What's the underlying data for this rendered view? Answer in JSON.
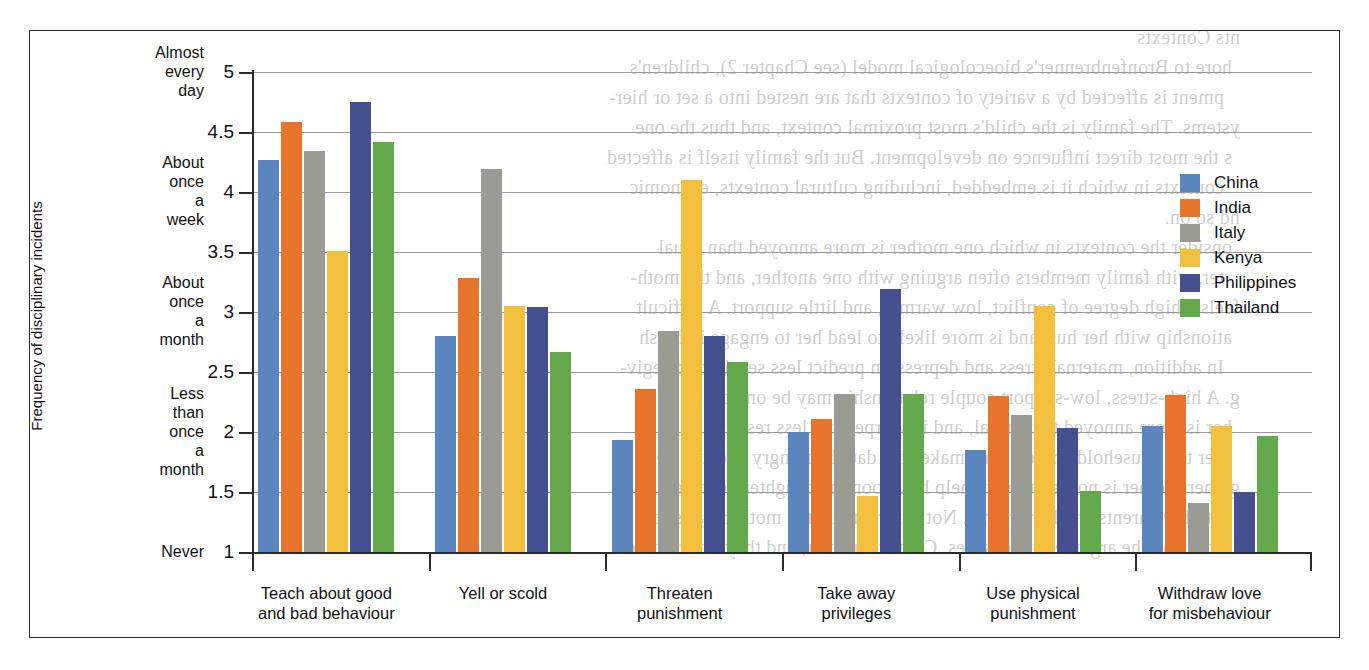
{
  "chart_data": {
    "type": "bar",
    "title": "",
    "xlabel": "",
    "ylabel": "Frequency of disciplinary incidents",
    "ylim": [
      1,
      5
    ],
    "grid": true,
    "legend_position": "upper-right-inside",
    "categories": [
      "Teach about good\nand bad behaviour",
      "Yell or scold",
      "Threaten\npunishment",
      "Take away\nprivileges",
      "Use physical\npunishment",
      "Withdraw love\nfor misbehaviour"
    ],
    "yticks": [
      {
        "value": 1,
        "label": "1",
        "category_label": "Never"
      },
      {
        "value": 1.5,
        "label": "1.5",
        "category_label": ""
      },
      {
        "value": 2,
        "label": "2",
        "category_label": "Less than once\na month"
      },
      {
        "value": 2.5,
        "label": "2.5",
        "category_label": ""
      },
      {
        "value": 3,
        "label": "3",
        "category_label": "About once\na month"
      },
      {
        "value": 3.5,
        "label": "3.5",
        "category_label": ""
      },
      {
        "value": 4,
        "label": "4",
        "category_label": "About once\na week"
      },
      {
        "value": 4.5,
        "label": "4.5",
        "category_label": ""
      },
      {
        "value": 5,
        "label": "5",
        "category_label": "Almost\nevery day"
      }
    ],
    "series": [
      {
        "name": "China",
        "color": "#5b85bf",
        "values": [
          4.27,
          2.8,
          1.93,
          2.0,
          1.85,
          2.05
        ]
      },
      {
        "name": "India",
        "color": "#e8732b",
        "values": [
          4.58,
          3.28,
          2.36,
          2.11,
          2.3,
          2.31
        ]
      },
      {
        "name": "Italy",
        "color": "#9b9b94",
        "values": [
          4.34,
          4.19,
          2.84,
          2.32,
          2.14,
          1.41
        ]
      },
      {
        "name": "Kenya",
        "color": "#f2c03e",
        "values": [
          3.51,
          3.05,
          4.1,
          1.47,
          3.05,
          2.05
        ]
      },
      {
        "name": "Philippines",
        "color": "#47508f",
        "values": [
          4.75,
          3.04,
          2.8,
          3.19,
          2.03,
          1.5
        ]
      },
      {
        "name": "Thailand",
        "color": "#63a84a",
        "values": [
          4.42,
          2.67,
          2.58,
          2.32,
          1.51,
          1.97
        ]
      }
    ]
  },
  "legend": {
    "items": [
      {
        "label": "China",
        "color": "#5b85bf"
      },
      {
        "label": "India",
        "color": "#e8732b"
      },
      {
        "label": "Italy",
        "color": "#9b9b94"
      },
      {
        "label": "Kenya",
        "color": "#f2c03e"
      },
      {
        "label": "Philippines",
        "color": "#47508f"
      },
      {
        "label": "Thailand",
        "color": "#63a84a"
      }
    ]
  },
  "page_bleed_text": [
    "nts Contexts",
    "hore to Bronfenbrenner's bioecological model (see Chapter 2), children's",
    "pment is affected by a variety of contexts that are nested into a set or hier-",
    "ystems. The family is the child's most proximal context, and thus the one",
    "s the most direct influence on development. But the family itself is affected",
    "contexts in which it is embedded, including cultural contexts, economic",
    "nd so on.",
    "onsider the contexts in which one mother is more annoyed than usual",
    "ter, with family members often arguing with one another, and the moth-",
    "feels a high degree of conflict, low warmth, and little support. A difficult",
    "ationship with her husband is more likely to lead her to engage in harsh",
    "In addition, maternal stress and depression predict less sensitive caregiv-",
    "g. A high-stress, low-support couple relationship may be one of the",
    "her is more annoyed than usual, and is sharper and less responsive",
    "her the household chores. This makes the daughter angry because her",
    "gh her brother is not required to help her. Soon the daughter becomes",
    "both her parents and her brother. Not surprisingly, the mother starts to",
    "hore and the argument intensifies. Contexts matter, and they reverberate"
  ]
}
